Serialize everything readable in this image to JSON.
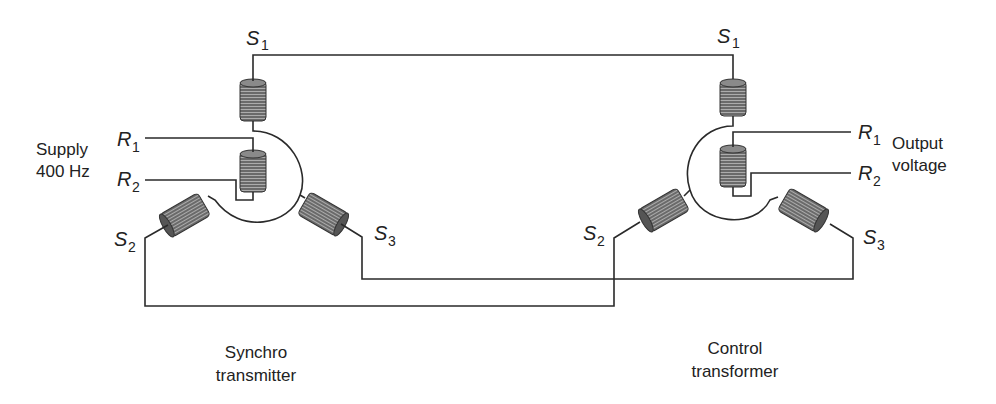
{
  "diagram": {
    "type": "synchro transmitter to control transformer wiring",
    "transmitter": {
      "caption_line1": "Synchro",
      "caption_line2": "transmitter",
      "supply_line1": "Supply",
      "supply_line2": "400 Hz",
      "terminals": {
        "s1": {
          "main": "S",
          "sub": "1"
        },
        "s2": {
          "main": "S",
          "sub": "2"
        },
        "s3": {
          "main": "S",
          "sub": "3"
        },
        "r1": {
          "main": "R",
          "sub": "1"
        },
        "r2": {
          "main": "R",
          "sub": "2"
        }
      }
    },
    "control_transformer": {
      "caption_line1": "Control",
      "caption_line2": "transformer",
      "output_line1": "Output",
      "output_line2": "voltage",
      "terminals": {
        "s1": {
          "main": "S",
          "sub": "1"
        },
        "s2": {
          "main": "S",
          "sub": "2"
        },
        "s3": {
          "main": "S",
          "sub": "3"
        },
        "r1": {
          "main": "R",
          "sub": "1"
        },
        "r2": {
          "main": "R",
          "sub": "2"
        }
      }
    },
    "connections": [
      "Transmitter S1 to Control transformer S1",
      "Transmitter S2 to Control transformer S2",
      "Transmitter S3 to Control transformer S3"
    ],
    "colors": {
      "wire": "#2a2a2a",
      "coil": "#6e6e6e",
      "background": "#ffffff"
    }
  }
}
